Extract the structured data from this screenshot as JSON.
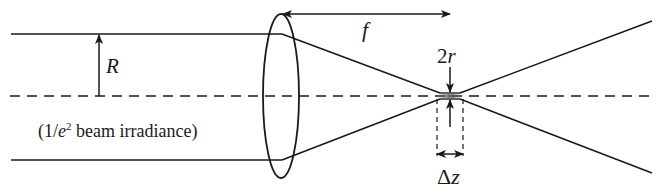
{
  "diagram": {
    "type": "optics-schematic",
    "labels": {
      "beam_radius": "R",
      "focal_length": "f",
      "waist_diameter_num": "2",
      "waist_diameter_var": "r",
      "beam_note_prefix": "(1/",
      "beam_note_e": "e",
      "beam_note_sup": "2",
      "beam_note_suffix": " beam irradiance)",
      "depth_of_focus_delta": "Δ",
      "depth_of_focus_var": "z"
    },
    "colors": {
      "line": "#1a1a1a",
      "background": "#ffffff",
      "waist_glow": "#555555"
    },
    "elements": [
      "incoming collimated beam (top and bottom edges)",
      "optical axis (dashed)",
      "lens (ellipse)",
      "converging rays to focus",
      "diverging rays after focus",
      "beam radius arrow R",
      "focal length double arrow f",
      "waist diameter arrows 2r",
      "depth of focus bracket Δz"
    ]
  }
}
